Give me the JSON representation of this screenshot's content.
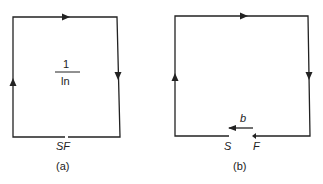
{
  "diagrams": [
    {
      "caption": "(a)",
      "fraction_numerator": "1",
      "fraction_denominator": "ln",
      "gap_label": "SF"
    },
    {
      "caption": "(b)",
      "vector_label": "b",
      "start_label": "S",
      "finish_label": "F"
    }
  ],
  "colors": {
    "line": "#222222",
    "background": "#ffffff"
  }
}
